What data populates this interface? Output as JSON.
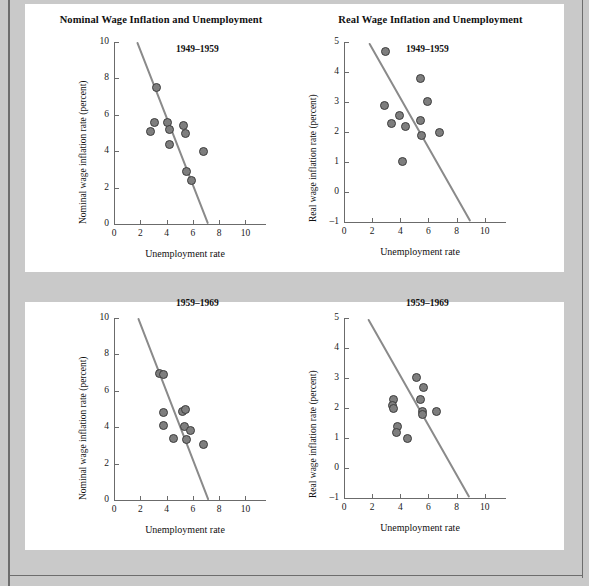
{
  "figure": {
    "background_color": "#c9c9c9",
    "panel_color": "#ffffff",
    "marker_color": "#7e7e7e",
    "marker_edge_color": "#3d3d3d",
    "trendline_color": "#8a8a8a",
    "axis_color": "#6b6b6b"
  },
  "panels": [
    {
      "title": "Nominal Wage Inflation and Unemployment"
    },
    {
      "title": "Real Wage Inflation and Unemployment"
    }
  ],
  "chart_data": [
    {
      "id": "nominal-1949-1959",
      "type": "scatter",
      "title": "Nominal Wage Inflation and Unemployment",
      "annotation": "1949–1959",
      "xlabel": "Unemployment rate",
      "ylabel": "Nominal wage inflation rate (percent)",
      "xlim": [
        0,
        10.8
      ],
      "ylim": [
        0,
        10
      ],
      "xticks": [
        0,
        2,
        4,
        6,
        8,
        10
      ],
      "xticklabels": [
        "0",
        "2",
        "4",
        "6",
        "8",
        "10"
      ],
      "yticks": [
        0,
        2,
        4,
        6,
        8,
        10
      ],
      "yticklabels": [
        "0",
        "2",
        "4",
        "6",
        "8",
        "10"
      ],
      "grid": false,
      "legend": "none",
      "points": [
        {
          "x": 2.8,
          "y": 5.1
        },
        {
          "x": 3.1,
          "y": 5.6
        },
        {
          "x": 3.2,
          "y": 7.5
        },
        {
          "x": 4.1,
          "y": 5.6
        },
        {
          "x": 4.25,
          "y": 5.2
        },
        {
          "x": 4.2,
          "y": 4.35
        },
        {
          "x": 5.3,
          "y": 5.4
        },
        {
          "x": 5.4,
          "y": 5.0
        },
        {
          "x": 5.5,
          "y": 2.9
        },
        {
          "x": 5.9,
          "y": 2.4
        },
        {
          "x": 6.8,
          "y": 4.0
        }
      ],
      "trendline": {
        "x0": 1.75,
        "y0": 10.0,
        "x1": 7.15,
        "y1": 0.0
      }
    },
    {
      "id": "real-1949-1959",
      "type": "scatter",
      "title": "Real Wage Inflation and Unemployment",
      "annotation": "1949–1959",
      "xlabel": "Unemployment rate",
      "ylabel": "Real wage inflation rate (percent)",
      "xlim": [
        0,
        10.8
      ],
      "ylim": [
        -1,
        5
      ],
      "xticks": [
        0,
        2,
        4,
        6,
        8,
        10
      ],
      "xticklabels": [
        "0",
        "2",
        "4",
        "6",
        "8",
        "10"
      ],
      "yticks": [
        -1,
        0,
        1,
        2,
        3,
        4,
        5
      ],
      "yticklabels": [
        "–1",
        "0",
        "1",
        "2",
        "3",
        "4",
        "5"
      ],
      "grid": false,
      "legend": "none",
      "points": [
        {
          "x": 2.95,
          "y": 4.7
        },
        {
          "x": 2.9,
          "y": 2.87
        },
        {
          "x": 3.4,
          "y": 2.27
        },
        {
          "x": 3.95,
          "y": 2.55
        },
        {
          "x": 4.15,
          "y": 1.02
        },
        {
          "x": 4.35,
          "y": 2.2
        },
        {
          "x": 5.4,
          "y": 3.8
        },
        {
          "x": 5.4,
          "y": 2.37
        },
        {
          "x": 5.5,
          "y": 1.9
        },
        {
          "x": 5.95,
          "y": 3.02
        },
        {
          "x": 6.75,
          "y": 1.97
        }
      ],
      "trendline": {
        "x0": 1.75,
        "y0": 4.95,
        "x1": 8.95,
        "y1": -1.0
      }
    },
    {
      "id": "nominal-1959-1969",
      "type": "scatter",
      "title": "Nominal Wage Inflation and Unemployment",
      "annotation": "1959–1969",
      "xlabel": "Unemployment rate",
      "ylabel": "Nominal wage inflation rate (percent)",
      "xlim": [
        0,
        10.8
      ],
      "ylim": [
        0,
        10
      ],
      "xticks": [
        0,
        2,
        4,
        6,
        8,
        10
      ],
      "xticklabels": [
        "0",
        "2",
        "4",
        "6",
        "8",
        "10"
      ],
      "yticks": [
        0,
        2,
        4,
        6,
        8,
        10
      ],
      "yticklabels": [
        "0",
        "2",
        "4",
        "6",
        "8",
        "10"
      ],
      "grid": false,
      "legend": "none",
      "points": [
        {
          "x": 3.45,
          "y": 6.95
        },
        {
          "x": 3.75,
          "y": 6.88
        },
        {
          "x": 3.8,
          "y": 4.8
        },
        {
          "x": 3.8,
          "y": 4.1
        },
        {
          "x": 4.5,
          "y": 3.4
        },
        {
          "x": 5.2,
          "y": 4.85
        },
        {
          "x": 5.4,
          "y": 5.0
        },
        {
          "x": 5.35,
          "y": 4.05
        },
        {
          "x": 5.5,
          "y": 3.35
        },
        {
          "x": 5.85,
          "y": 3.8
        },
        {
          "x": 6.8,
          "y": 3.05
        }
      ],
      "trendline": {
        "x0": 1.8,
        "y0": 10.0,
        "x1": 7.15,
        "y1": 0.0
      }
    },
    {
      "id": "real-1959-1969",
      "type": "scatter",
      "title": "Real Wage Inflation and Unemployment",
      "annotation": "1959–1969",
      "xlabel": "Unemployment rate",
      "ylabel": "Real wage inflation rate (percent)",
      "xlim": [
        0,
        10.8
      ],
      "ylim": [
        -1,
        5
      ],
      "xticks": [
        0,
        2,
        4,
        6,
        8,
        10
      ],
      "xticklabels": [
        "0",
        "2",
        "4",
        "6",
        "8",
        "10"
      ],
      "yticks": [
        -1,
        0,
        1,
        2,
        3,
        4,
        5
      ],
      "yticklabels": [
        "–1",
        "0",
        "1",
        "2",
        "3",
        "4",
        "5"
      ],
      "grid": false,
      "legend": "none",
      "points": [
        {
          "x": 3.5,
          "y": 2.3
        },
        {
          "x": 3.45,
          "y": 2.1
        },
        {
          "x": 3.5,
          "y": 2.0
        },
        {
          "x": 3.8,
          "y": 1.4
        },
        {
          "x": 3.75,
          "y": 1.2
        },
        {
          "x": 4.5,
          "y": 1.0
        },
        {
          "x": 5.15,
          "y": 3.02
        },
        {
          "x": 5.45,
          "y": 2.3
        },
        {
          "x": 5.55,
          "y": 1.9
        },
        {
          "x": 5.55,
          "y": 1.8
        },
        {
          "x": 5.65,
          "y": 2.68
        },
        {
          "x": 6.6,
          "y": 1.9
        }
      ],
      "trendline": {
        "x0": 1.7,
        "y0": 4.95,
        "x1": 8.9,
        "y1": -1.0
      }
    }
  ]
}
